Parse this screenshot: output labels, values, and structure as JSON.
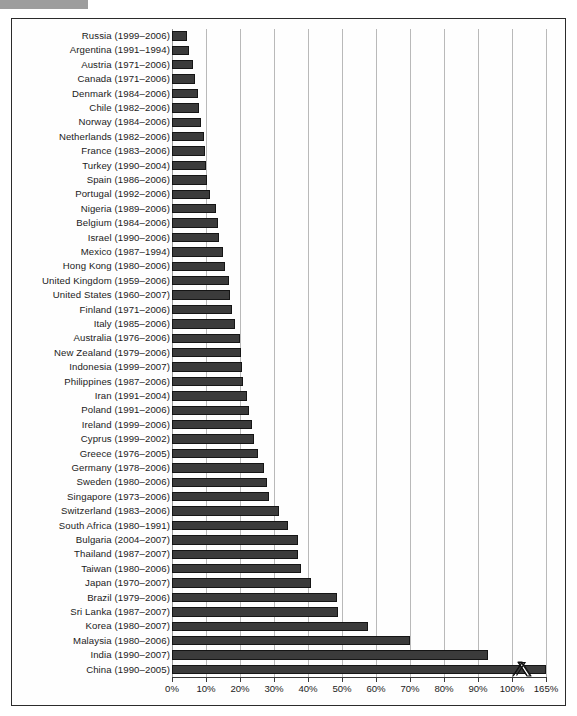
{
  "figure": {
    "frame_border_color": "#2b2b2b",
    "background": "#ffffff",
    "top_band_color": "#9d9d9d"
  },
  "chart_data": {
    "type": "bar",
    "orientation": "horizontal",
    "title": "",
    "subtitle": "",
    "xlabel": "",
    "ylabel": "",
    "xlim": [
      0,
      100
    ],
    "xtick_labels": [
      "0%",
      "10%",
      "20%",
      "30%",
      "40%",
      "50%",
      "60%",
      "70%",
      "80%",
      "90%",
      "100%",
      "165%"
    ],
    "xtick_values": [
      0,
      10,
      20,
      30,
      40,
      50,
      60,
      70,
      80,
      90,
      100,
      110
    ],
    "axis_break": {
      "present": true,
      "marker": "zigzag",
      "after_value": 100,
      "final_label": "165%",
      "applies_to": "China (1990-2005)"
    },
    "grid": true,
    "legend": null,
    "bar_color": "#3b3b3b",
    "bar_edge_color": "#151515",
    "categories": [
      "Russia (1999–2006)",
      "Argentina (1991–1994)",
      "Austria (1971–2006)",
      "Canada (1971–2006)",
      "Denmark (1984–2006)",
      "Chile (1982–2006)",
      "Norway (1984–2006)",
      "Netherlands (1982–2006)",
      "France (1983–2006)",
      "Turkey (1990–2004)",
      "Spain (1986–2006)",
      "Portugal (1992–2006)",
      "Nigeria (1989–2006)",
      "Belgium (1984–2006)",
      "Israel (1990–2006)",
      "Mexico (1987–1994)",
      "Hong Kong (1980–2006)",
      "United Kingdom (1959–2006)",
      "United States (1960–2007)",
      "Finland (1971–2006)",
      "Italy (1985–2006)",
      "Australia (1976–2006)",
      "New Zealand (1979–2006)",
      "Indonesia (1999–2007)",
      "Philippines (1987–2006)",
      "Iran (1991–2004)",
      "Poland (1991–2006)",
      "Ireland (1999–2006)",
      "Cyprus (1999–2002)",
      "Greece (1976–2005)",
      "Germany (1978–2006)",
      "Sweden (1980–2006)",
      "Singapore (1973–2006)",
      "Switzerland (1983–2006)",
      "South Africa (1980–1991)",
      "Bulgaria (2004–2007)",
      "Thailand (1987–2007)",
      "Taiwan (1980–2006)",
      "Japan (1970–2007)",
      "Brazil (1979–2006)",
      "Sri Lanka (1987–2007)",
      "Korea (1980–2007)",
      "Malaysia (1980–2006)",
      "India (1990–2007)",
      "China (1990–2005)"
    ],
    "values": [
      4.5,
      5.0,
      6.2,
      6.8,
      7.6,
      7.8,
      8.6,
      9.4,
      9.8,
      10.0,
      10.2,
      11.2,
      12.8,
      13.4,
      13.8,
      15.0,
      15.6,
      16.8,
      17.0,
      17.6,
      18.6,
      20.0,
      20.4,
      20.6,
      20.8,
      22.0,
      22.6,
      23.4,
      24.0,
      25.4,
      27.0,
      27.8,
      28.6,
      31.6,
      34.0,
      37.0,
      37.2,
      37.8,
      40.8,
      48.4,
      48.8,
      57.6,
      70.0,
      93.0,
      165.0
    ],
    "value_suffix": "%",
    "note": "Bar lengths read from the 0%-100% linear axis; the final category China extends past the axis break to 165%."
  }
}
